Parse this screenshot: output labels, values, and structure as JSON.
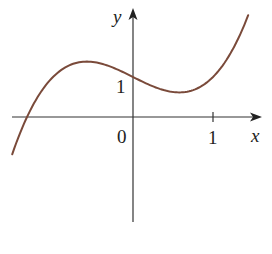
{
  "chart_data": {
    "type": "line",
    "title": "",
    "function": "y = x^3 - x + 1",
    "xlabel": "x",
    "ylabel": "y",
    "x_tick_labels": [
      "0",
      "1"
    ],
    "y_tick_labels": [
      "1"
    ],
    "xlim": [
      -1.51,
      1.44
    ],
    "ylim": [
      -0.93,
      2.54
    ],
    "grid": false,
    "legend": null,
    "curve_color": "#7a4a3a",
    "axis_color": "#333333",
    "series": [
      {
        "name": "f(x)",
        "x": [
          -1.5,
          -1.32,
          -1.0,
          -0.577,
          0.0,
          0.577,
          1.0,
          1.44
        ],
        "y": [
          -0.875,
          0.0,
          1.0,
          1.385,
          1.0,
          0.615,
          1.0,
          2.546
        ]
      }
    ],
    "annotations": {
      "local_max": [
        -0.577,
        1.385
      ],
      "local_min": [
        0.577,
        0.615
      ],
      "y_intercept": [
        0,
        1
      ],
      "root": [
        -1.32,
        0
      ]
    }
  },
  "labels": {
    "x_axis": "x",
    "y_axis": "y",
    "origin": "0",
    "x_tick_one": "1",
    "y_tick_one": "1"
  }
}
